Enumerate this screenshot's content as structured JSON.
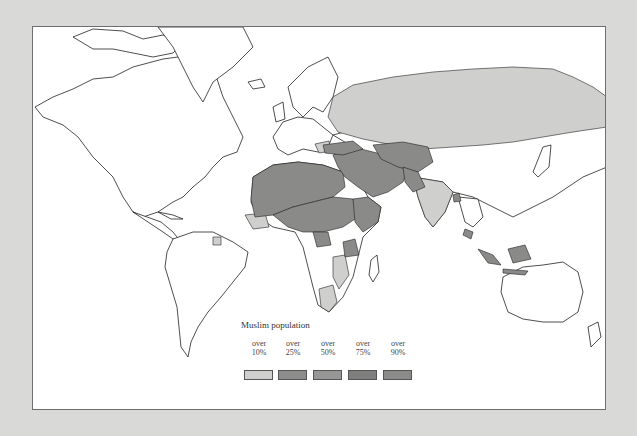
{
  "map": {
    "title": "World map of Muslim population distribution",
    "legend": {
      "title": "Muslim population",
      "items": [
        {
          "over": "over",
          "pct": "10%",
          "color": "#cfcfcd"
        },
        {
          "over": "over",
          "pct": "25%",
          "color": "#8d8d8b"
        },
        {
          "over": "over",
          "pct": "50%",
          "color": "#979795"
        },
        {
          "over": "over",
          "pct": "75%",
          "color": "#7e7e7c"
        },
        {
          "over": "over",
          "pct": "90%",
          "color": "#8a8a88"
        }
      ]
    },
    "colors": {
      "background": "#d9d9d7",
      "land": "#ffffff",
      "outline": "#222222",
      "light": "#cfcfcd",
      "dark": "#8a8a88"
    }
  }
}
